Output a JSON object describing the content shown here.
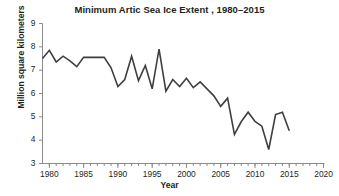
{
  "chart_data": {
    "type": "line",
    "title": "Minimum Artic Sea Ice Extent , 1980–2015",
    "xlabel": "Year",
    "ylabel": "Million square kilometers",
    "xlim": [
      1979,
      2020
    ],
    "ylim": [
      3,
      9
    ],
    "xticks": [
      1980,
      1985,
      1990,
      1995,
      2000,
      2005,
      2010,
      2015,
      2020
    ],
    "xtick_labels": [
      "1980",
      "1985",
      "1990",
      "1995",
      "2000",
      "2005",
      "2010",
      "2015",
      "2020"
    ],
    "yticks": [
      3,
      4,
      5,
      6,
      7,
      8,
      9
    ],
    "ytick_labels": [
      "3",
      "4",
      "5",
      "6",
      "7",
      "8",
      "9"
    ],
    "minor_xtick_interval": 1,
    "grid": false,
    "legend": false,
    "line_color": "#3f3f42",
    "line_width": 1.6,
    "x": [
      1979,
      1980,
      1981,
      1982,
      1983,
      1984,
      1985,
      1986,
      1987,
      1988,
      1989,
      1990,
      1991,
      1992,
      1993,
      1994,
      1995,
      1996,
      1997,
      1998,
      1999,
      2000,
      2001,
      2002,
      2003,
      2004,
      2005,
      2006,
      2007,
      2008,
      2009,
      2010,
      2011,
      2012,
      2013,
      2014,
      2015
    ],
    "values": [
      7.5,
      7.85,
      7.35,
      7.6,
      7.4,
      7.15,
      7.55,
      7.55,
      7.55,
      7.55,
      7.1,
      6.3,
      6.6,
      7.6,
      6.55,
      7.2,
      6.2,
      7.9,
      6.1,
      6.6,
      6.3,
      6.65,
      6.25,
      6.5,
      6.2,
      5.9,
      5.45,
      5.8,
      4.25,
      4.8,
      5.2,
      4.8,
      4.6,
      3.6,
      5.1,
      5.2,
      4.4
    ]
  }
}
